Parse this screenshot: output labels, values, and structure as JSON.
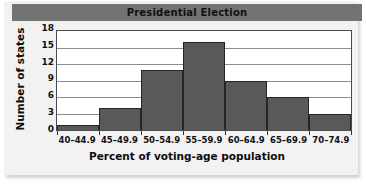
{
  "chart_data": {
    "type": "bar",
    "title": "Presidential Election",
    "xlabel": "Percent of voting-age population",
    "ylabel": "Number of states",
    "categories": [
      "40–44.9",
      "45–49.9",
      "50–54.9",
      "55–59.9",
      "60–64.9",
      "65–69.9",
      "70–74.9"
    ],
    "values": [
      1,
      4,
      11,
      16,
      9,
      6,
      3
    ],
    "yticks": [
      18,
      15,
      12,
      9,
      6,
      3,
      0
    ],
    "ylim": [
      0,
      18
    ],
    "grid": true,
    "legend": false,
    "colors": {
      "bar_fill": "#595959",
      "bar_outline": "#262626",
      "title_banner": "#737373",
      "plot_background": "#ffffff",
      "gridline": "#8c8c8c",
      "plate_background": "#f2f2f2"
    }
  }
}
